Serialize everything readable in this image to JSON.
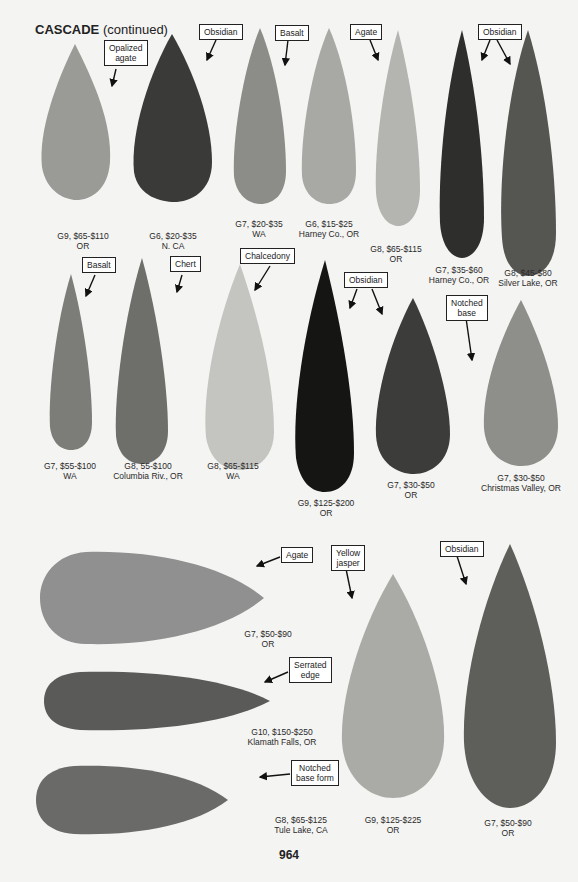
{
  "header": {
    "title_bold": "CASCADE",
    "title_rest": " (continued)"
  },
  "page_number": "964",
  "labels": {
    "opalized_agate": "Opalized\nagate",
    "obsidian1": "Obsidian",
    "basalt1": "Basalt",
    "agate1": "Agate",
    "obsidian2": "Obsidian",
    "basalt2": "Basalt",
    "chert": "Chert",
    "chalcedony": "Chalcedony",
    "obsidian3": "Obsidian",
    "notched_base": "Notched\nbase",
    "agate2": "Agate",
    "yellow_jasper": "Yellow\njasper",
    "obsidian4": "Obsidian",
    "serrated_edge": "Serrated\nedge",
    "notched_base_form": "Notched\nbase form"
  },
  "points": [
    {
      "grade": "G9, $65-$110",
      "loc": "OR"
    },
    {
      "grade": "G6, $20-$35",
      "loc": "N. CA"
    },
    {
      "grade": "G7, $20-$35",
      "loc": "WA"
    },
    {
      "grade": "G6, $15-$25",
      "loc": "Harney Co., OR"
    },
    {
      "grade": "G8, $65-$115",
      "loc": "OR"
    },
    {
      "grade": "G7, $35-$60",
      "loc": "Harney Co., OR"
    },
    {
      "grade": "G8, $45-$80",
      "loc": "Silver Lake, OR"
    },
    {
      "grade": "G7, $55-$100",
      "loc": "WA"
    },
    {
      "grade": "G8, 55-$100",
      "loc": "Columbia Riv., OR"
    },
    {
      "grade": "G8, $65-$115",
      "loc": "WA"
    },
    {
      "grade": "G9, $125-$200",
      "loc": "OR"
    },
    {
      "grade": "G7, $30-$50",
      "loc": "OR"
    },
    {
      "grade": "G7, $30-$50",
      "loc": "Christmas Valley, OR"
    },
    {
      "grade": "G7, $50-$90",
      "loc": "OR"
    },
    {
      "grade": "G10, $150-$250",
      "loc": "Klamath Falls, OR"
    },
    {
      "grade": "G8, $65-$125",
      "loc": "Tule Lake, CA"
    },
    {
      "grade": "G9, $125-$225",
      "loc": "OR"
    },
    {
      "grade": "G7, $50-$90",
      "loc": "OR"
    }
  ]
}
